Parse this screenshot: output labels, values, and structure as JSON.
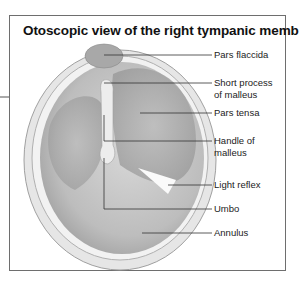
{
  "title": "Otoscopic view of the right tympanic membrane",
  "labels": [
    {
      "id": "pars-flaccida",
      "text": "Pars flaccida",
      "line2": "",
      "y": 49
    },
    {
      "id": "short-process",
      "text": "Short process",
      "line2": "of malleus",
      "y": 77
    },
    {
      "id": "pars-tensa",
      "text": "Pars tensa",
      "line2": "",
      "y": 107
    },
    {
      "id": "handle",
      "text": "Handle of",
      "line2": "malleus",
      "y": 135
    },
    {
      "id": "light-reflex",
      "text": "Light reflex",
      "line2": "",
      "y": 179
    },
    {
      "id": "umbo",
      "text": "Umbo",
      "line2": "",
      "y": 203
    },
    {
      "id": "annulus",
      "text": "Annulus",
      "line2": "",
      "y": 227
    }
  ],
  "colors": {
    "frame": "#6e6e6e",
    "leader": "#333333",
    "membrane": "#c9c9c9",
    "shade": "#a9a9a9"
  }
}
